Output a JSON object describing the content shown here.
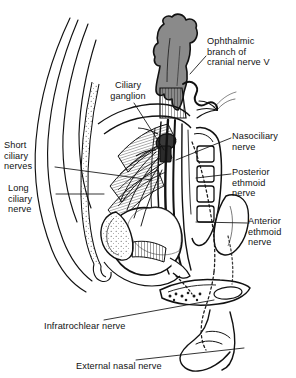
{
  "figure": {
    "background_color": "#ffffff",
    "ink_color": "#111111",
    "tissue_gray": "#8a8a8a",
    "width": 296,
    "height": 378
  },
  "labels": {
    "ophthalmic": "Ophthalmic\nbranch of\ncranial nerve V",
    "ciliary_ganglion": "Ciliary\nganglion",
    "nasociliary": "Nasociliary\nnerve",
    "short_ciliary": "Short\nciliary\nnerves",
    "posterior_ethmoid": "Posterior\nethmoid\nnerve",
    "long_ciliary": "Long\nciliary\nnerve",
    "anterior_ethmoid": "Anterior\nethmoid\nnerve",
    "infratrochlear": "Infratrochlear nerve",
    "external_nasal": "External nasal nerve"
  },
  "structures": {
    "brain_lobe": "frontal-lobe-gray-mass",
    "optic_canal_hatching": "optic-canal-hatched-bone",
    "globe": "eyeball-globe",
    "lens_region": "anterior-segment",
    "ethmoid_cells": "ethmoid-air-cells",
    "nasal_septum": "nasal-septum-outline",
    "nose_tip": "external-nose-profile"
  }
}
